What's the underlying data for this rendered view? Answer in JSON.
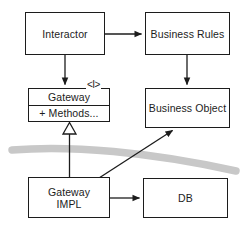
{
  "diagram": {
    "type": "uml-component-diagram",
    "width": 242,
    "height": 232,
    "background_color": "#ffffff",
    "line_color": "#1c1c1c",
    "boundary_band_color": "#c8c8c8"
  },
  "nodes": [
    {
      "id": "interactor",
      "label": "Interactor",
      "x": 25,
      "y": 12,
      "w": 80,
      "h": 43,
      "compartments": false
    },
    {
      "id": "business-rules",
      "label": "Business Rules",
      "x": 145,
      "y": 12,
      "w": 85,
      "h": 43,
      "compartments": false
    },
    {
      "id": "gateway",
      "label": "Gateway",
      "methods_label": "+ Methods...",
      "stereotype": "<I>",
      "x": 28,
      "y": 88,
      "w": 82,
      "h": 34,
      "compartments": true
    },
    {
      "id": "business-object",
      "label": "Business Object",
      "x": 145,
      "y": 88,
      "w": 85,
      "h": 40,
      "compartments": false
    },
    {
      "id": "gateway-impl",
      "label": "Gateway\nIMPL",
      "x": 28,
      "y": 177,
      "w": 82,
      "h": 41,
      "compartments": false
    },
    {
      "id": "db",
      "label": "DB",
      "x": 143,
      "y": 178,
      "w": 85,
      "h": 40,
      "compartments": false
    }
  ],
  "connectors": [
    {
      "id": "interactor-to-business-rules",
      "from": "interactor",
      "to": "business-rules",
      "kind": "dependency-arrow",
      "arrowhead": "filled"
    },
    {
      "id": "interactor-to-gateway",
      "from": "interactor",
      "to": "gateway",
      "kind": "dependency-arrow",
      "arrowhead": "filled"
    },
    {
      "id": "business-rules-to-business-object",
      "from": "business-rules",
      "to": "business-object",
      "kind": "dependency-arrow",
      "arrowhead": "filled"
    },
    {
      "id": "gateway-impl-to-gateway",
      "from": "gateway-impl",
      "to": "gateway",
      "kind": "realization",
      "arrowhead": "hollow-triangle"
    },
    {
      "id": "gateway-impl-to-business-object",
      "from": "gateway-impl",
      "to": "business-object",
      "kind": "dependency-arrow",
      "arrowhead": "filled"
    },
    {
      "id": "gateway-impl-to-db",
      "from": "gateway-impl",
      "to": "db",
      "kind": "dependency-arrow",
      "arrowhead": "filled"
    }
  ],
  "boundary_band": {
    "id": "architecture-boundary",
    "description": "gray curved architectural boundary line",
    "color": "#c8c8c8",
    "thickness": 7
  }
}
